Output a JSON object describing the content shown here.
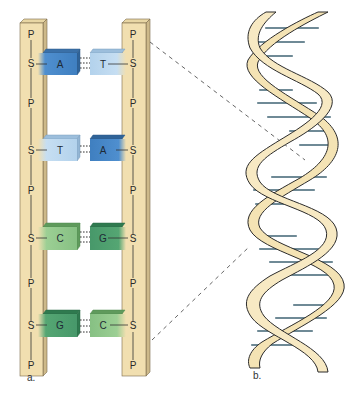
{
  "figure": {
    "panel_a": {
      "label": "a.",
      "left_strand": {
        "backbone": [
          "P",
          "S",
          "P",
          "S",
          "P",
          "S",
          "P",
          "S",
          "P"
        ]
      },
      "right_strand": {
        "backbone": [
          "P",
          "S",
          "P",
          "S",
          "P",
          "S",
          "P",
          "S",
          "P"
        ]
      },
      "base_pairs": [
        {
          "left": "A",
          "right": "T"
        },
        {
          "left": "T",
          "right": "A"
        },
        {
          "left": "C",
          "right": "G"
        },
        {
          "left": "G",
          "right": "C"
        }
      ]
    },
    "panel_b": {
      "label": "b."
    }
  },
  "colors": {
    "backbone": "#f1dfb0",
    "backbone_side": "#d9c596",
    "backbone_edge": "#7a6a4a",
    "adenine": "#4f8fcf",
    "thymine": "#b9d6ee",
    "cytosine": "#8cc48a",
    "guanine": "#4e9f6c",
    "helix_ribbon": "#f4e3b4",
    "helix_outline": "#2b2b2b",
    "rung": "#6f8a96",
    "dash": "#555555"
  }
}
